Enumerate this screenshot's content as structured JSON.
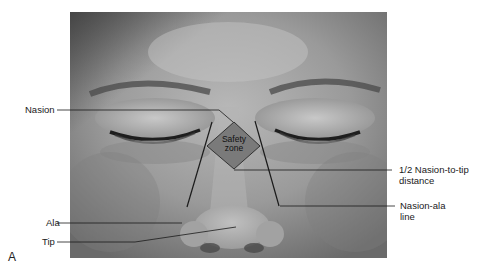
{
  "figure": {
    "panel_letter": "A",
    "safety_zone": {
      "line1": "Safety",
      "line2": "zone",
      "fill": "#7a7a7a"
    },
    "labels": {
      "nasion": "Nasion",
      "ala": "Ala",
      "tip": "Tip",
      "half_nasion_line1": "1/2 Nasion-to-tip",
      "half_nasion_line2": "distance",
      "nasion_ala_line1": "Nasion-ala",
      "nasion_ala_line2": "line"
    },
    "colors": {
      "line": "#1a1a1a",
      "photo_mid": "#8a8a8a",
      "photo_light": "#b5b5b5",
      "photo_dark": "#4a4a4a"
    }
  }
}
